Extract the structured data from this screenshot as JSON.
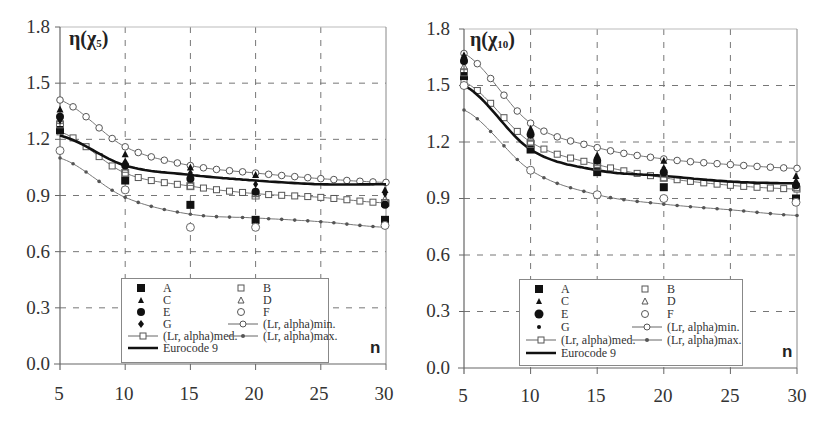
{
  "charts_meta": {
    "y_ticks": [
      "1.8",
      "1.5",
      "1.2",
      "0.9",
      "0.6",
      "0.3",
      "0.0"
    ],
    "x_ticks": [
      "5",
      "10",
      "15",
      "20",
      "25",
      "30"
    ],
    "x_axis_label": "n"
  },
  "legend": {
    "A": "A",
    "B": "B",
    "C": "C",
    "D": "D",
    "E": "E",
    "F": "F",
    "G": "G",
    "min": "(Lr, alpha)min.",
    "med": "(Lr, alpha)med.",
    "max": "(Lr, alpha)max.",
    "ec": "Eurocode 9"
  },
  "left": {
    "title_main": "η(χ",
    "title_sub": "5",
    "title_end": ")"
  },
  "right": {
    "title_main": "η(χ",
    "title_sub": "10",
    "title_end": ")"
  },
  "chart_data": [
    {
      "type": "line",
      "title": "η(χ5)",
      "xlabel": "n",
      "ylabel": "",
      "xlim": [
        5,
        30
      ],
      "ylim": [
        0.0,
        1.8
      ],
      "x_ticks": [
        5,
        10,
        15,
        20,
        25,
        30
      ],
      "y_ticks": [
        0.0,
        0.3,
        0.6,
        0.9,
        1.2,
        1.5,
        1.8
      ],
      "grid": true,
      "legend_position": "lower center (inside)",
      "x": [
        5,
        10,
        15,
        20,
        25,
        30
      ],
      "series": [
        {
          "name": "(Lr, alpha)min.",
          "marker": "open-circle-line",
          "values": [
            1.41,
            1.16,
            1.06,
            1.02,
            0.99,
            0.97
          ]
        },
        {
          "name": "(Lr, alpha)med.",
          "marker": "open-square-line",
          "values": [
            1.24,
            1.02,
            0.95,
            0.91,
            0.89,
            0.86
          ]
        },
        {
          "name": "(Lr, alpha)max.",
          "marker": "small-diamond-line",
          "values": [
            1.1,
            0.89,
            0.8,
            0.78,
            0.76,
            0.73
          ]
        },
        {
          "name": "Eurocode 9",
          "marker": "thick-line",
          "values": [
            1.22,
            1.06,
            1.01,
            0.98,
            0.96,
            0.96
          ]
        },
        {
          "name": "A",
          "marker": "filled-square",
          "values": [
            1.25,
            0.98,
            0.85,
            0.77,
            null,
            0.77
          ]
        },
        {
          "name": "B",
          "marker": "open-square",
          "values": [
            1.28,
            1.02,
            0.95,
            0.9,
            null,
            0.86
          ]
        },
        {
          "name": "C",
          "marker": "filled-triangle",
          "values": [
            1.36,
            1.12,
            1.05,
            1.01,
            null,
            0.93
          ]
        },
        {
          "name": "D",
          "marker": "open-triangle",
          "values": [
            1.3,
            1.04,
            0.97,
            0.91,
            null,
            0.88
          ]
        },
        {
          "name": "E",
          "marker": "filled-circle",
          "values": [
            1.32,
            1.06,
            0.99,
            0.92,
            null,
            0.85
          ]
        },
        {
          "name": "F",
          "marker": "open-circle",
          "values": [
            1.14,
            0.93,
            0.73,
            0.73,
            null,
            0.74
          ]
        },
        {
          "name": "G",
          "marker": "filled-diamond",
          "values": [
            1.3,
            1.08,
            1.02,
            0.96,
            null,
            0.91
          ]
        }
      ]
    },
    {
      "type": "line",
      "title": "η(χ10)",
      "xlabel": "n",
      "ylabel": "",
      "xlim": [
        5,
        30
      ],
      "ylim": [
        0.0,
        1.8
      ],
      "x_ticks": [
        5,
        10,
        15,
        20,
        25,
        30
      ],
      "y_ticks": [
        0.0,
        0.3,
        0.6,
        0.9,
        1.2,
        1.5,
        1.8
      ],
      "grid": true,
      "legend_position": "lower center (inside)",
      "x": [
        5,
        10,
        15,
        20,
        25,
        30
      ],
      "series": [
        {
          "name": "(Lr, alpha)min.",
          "marker": "open-circle-line",
          "values": [
            1.67,
            1.3,
            1.17,
            1.11,
            1.08,
            1.06
          ]
        },
        {
          "name": "(Lr, alpha)med.",
          "marker": "open-square-line",
          "values": [
            1.52,
            1.2,
            1.08,
            1.01,
            0.97,
            0.95
          ]
        },
        {
          "name": "(Lr, alpha)max.",
          "marker": "small-diamond-line",
          "values": [
            1.37,
            1.05,
            0.92,
            0.87,
            0.84,
            0.81
          ]
        },
        {
          "name": "Eurocode 9",
          "marker": "thick-line",
          "values": [
            1.5,
            1.16,
            1.05,
            1.02,
            0.99,
            0.98
          ]
        },
        {
          "name": "A",
          "marker": "filled-square",
          "values": [
            1.55,
            1.16,
            1.04,
            0.96,
            null,
            0.9
          ]
        },
        {
          "name": "B",
          "marker": "open-square",
          "values": [
            1.57,
            1.19,
            1.07,
            1.01,
            null,
            0.96
          ]
        },
        {
          "name": "C",
          "marker": "filled-triangle",
          "values": [
            1.66,
            1.27,
            1.13,
            1.1,
            null,
            1.02
          ]
        },
        {
          "name": "D",
          "marker": "open-triangle",
          "values": [
            1.6,
            1.22,
            1.09,
            1.03,
            null,
            0.98
          ]
        },
        {
          "name": "E",
          "marker": "filled-circle",
          "values": [
            1.63,
            1.24,
            1.1,
            1.04,
            null,
            0.97
          ]
        },
        {
          "name": "F",
          "marker": "open-circle",
          "values": [
            1.5,
            1.05,
            0.92,
            0.9,
            null,
            0.88
          ]
        },
        {
          "name": "G",
          "marker": "filled-diamond",
          "values": [
            1.64,
            1.25,
            1.11,
            1.06,
            null,
            0.99
          ]
        }
      ]
    }
  ]
}
